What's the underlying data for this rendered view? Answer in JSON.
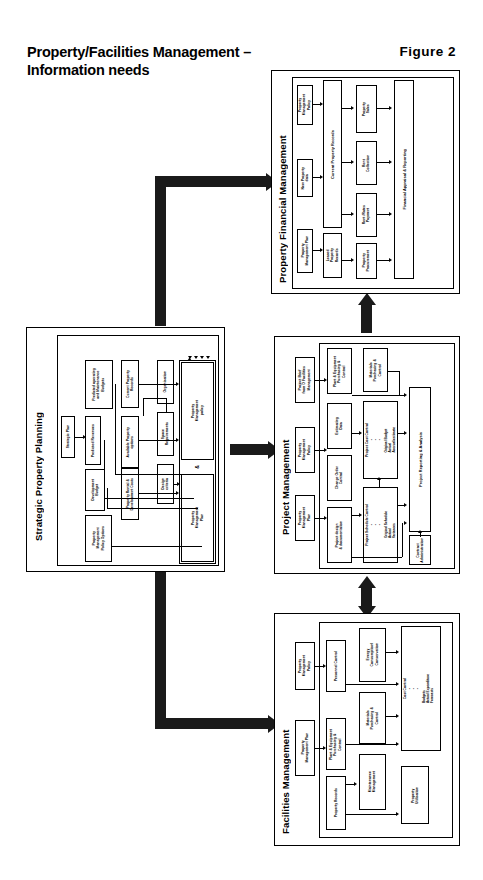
{
  "header": {
    "title": "Property/Facilities Management\n– Information needs",
    "figure": "Figure  2"
  },
  "diagram": {
    "type": "block-flow-diagram",
    "sections": [
      {
        "id": "strategic-property-planning",
        "title": "Strategic Property Planning",
        "nodes": [
          {
            "id": "strategic-plan",
            "label": "Strategic Plan"
          },
          {
            "id": "predicted-operating-budgets",
            "label": "Predicted operating\nand Maintenance\nBudgets"
          },
          {
            "id": "predicted-revenues",
            "label": "Predicted Revenues"
          },
          {
            "id": "development-budget",
            "label": "Development\nBudget"
          },
          {
            "id": "property-management-policy-options",
            "label": "Property\nManagement\nPolicy Options"
          },
          {
            "id": "current-property-records",
            "label": "Current Property\nRecords"
          },
          {
            "id": "available-property-options",
            "label": "Available Property\noptions"
          },
          {
            "id": "property-rental-development-costs",
            "label": "Property Rental &\nDevelopment Costs"
          },
          {
            "id": "organisation",
            "label": "Organisation"
          },
          {
            "id": "space-requirements",
            "label": "Space\nRequirements"
          },
          {
            "id": "design-criteria",
            "label": "Design\ncriteria"
          },
          {
            "id": "property-management-policy",
            "label": "Property\nManagement\npolicy"
          },
          {
            "id": "amp",
            "label": "&"
          },
          {
            "id": "property-management-plan",
            "label": "Property\nManagement\nPlan"
          }
        ]
      },
      {
        "id": "property-financial-management",
        "title": "Property Financial Management",
        "nodes": [
          {
            "id": "pfm-property-management-policy",
            "label": "Property\nManagement\nPolicy"
          },
          {
            "id": "pfm-new-property-data",
            "label": "New  Property\ndata"
          },
          {
            "id": "pfm-property-management-plan",
            "label": "Property\nManagement  Plan"
          },
          {
            "id": "pfm-current-property-records",
            "label": "Current Property Records"
          },
          {
            "id": "pfm-leased-property-records",
            "label": "Leased\nProperty\nRecords"
          },
          {
            "id": "pfm-property-sales",
            "label": "Property\nSales"
          },
          {
            "id": "pfm-rent-collection",
            "label": "Rent\nCollection"
          },
          {
            "id": "pfm-rent-rates-payment",
            "label": "Rent /Rates\nPayment"
          },
          {
            "id": "pfm-property-procurement",
            "label": "Property\nProcurement"
          },
          {
            "id": "pfm-financial-appraisal-reporting",
            "label": "Financial Appraisal & Reporting"
          }
        ]
      },
      {
        "id": "project-management",
        "title": "Project Management",
        "nodes": [
          {
            "id": "pm-project-brief",
            "label": "Project  Brief\nfrom  O  Facilities\nManagement"
          },
          {
            "id": "pm-property-management-policy",
            "label": "Property\nManagement\nPolicy"
          },
          {
            "id": "pm-property-management-plan",
            "label": "Property\nManagement\nPlan"
          },
          {
            "id": "pm-plant-equipment",
            "label": "Plant & Equipment\nPurchasing &\nControl"
          },
          {
            "id": "pm-materials-purchasing",
            "label": "Materials\nPurchasing &\nControl"
          },
          {
            "id": "pm-estimating-data",
            "label": "Estimating\nData"
          },
          {
            "id": "pm-change-order-control",
            "label": "Change Order\nControl"
          },
          {
            "id": "pm-project-design-documentation",
            "label": "Project  design\n&  documentation"
          },
          {
            "id": "pm-project-cost-control",
            "label": "Project Cost Control",
            "bullets": [
              "Original Budget",
              "Actual",
              "Accrual/estimate"
            ]
          },
          {
            "id": "pm-project-schedule-control",
            "label": "Project Schedule Control",
            "bullets": [
              "Original Schedule",
              "Actual",
              "Variances"
            ]
          },
          {
            "id": "pm-project-reporting-analysis",
            "label": "Project Reporting & Analysis"
          },
          {
            "id": "pm-contract-administration",
            "label": "Contract\nAdministration"
          }
        ]
      },
      {
        "id": "facilities-management",
        "title": "Facilities Management",
        "nodes": [
          {
            "id": "fm-property-management-policy",
            "label": "Property\nManagement\nPolicy"
          },
          {
            "id": "fm-property-management-plan",
            "label": "Property\nManagement  Plan"
          },
          {
            "id": "fm-personnel-control",
            "label": "Personnel Control"
          },
          {
            "id": "fm-plant-equipment",
            "label": "Plant & Equipment\nPurchasing &\nControl"
          },
          {
            "id": "fm-property-records",
            "label": "Property Records"
          },
          {
            "id": "fm-energy-consumption",
            "label": "Energy\nConsumption/\nConservation"
          },
          {
            "id": "fm-materials-purchasing",
            "label": "Materials\nPurchasing &\nControl"
          },
          {
            "id": "fm-maintenance-management",
            "label": "Maintenance\nManagement"
          },
          {
            "id": "fm-cost-control",
            "label": "Cost Control",
            "bullets": [
              "Budgets",
              "Actual Expenditure",
              "Forecasts"
            ]
          },
          {
            "id": "fm-property-utilisation",
            "label": "Property\nUtilisation"
          }
        ]
      }
    ],
    "flows": [
      {
        "id": "flow-spp-to-pfm",
        "from": "strategic-property-planning",
        "to": "property-financial-management",
        "direction": "one-way"
      },
      {
        "id": "flow-spp-to-pm",
        "from": "strategic-property-planning",
        "to": "project-management",
        "direction": "one-way"
      },
      {
        "id": "flow-spp-to-fm",
        "from": "strategic-property-planning",
        "to": "facilities-management",
        "direction": "one-way"
      },
      {
        "id": "flow-pm-to-pfm",
        "from": "project-management",
        "to": "property-financial-management",
        "direction": "one-way"
      },
      {
        "id": "flow-pm-fm",
        "from": "project-management",
        "to": "facilities-management",
        "direction": "two-way"
      }
    ]
  }
}
